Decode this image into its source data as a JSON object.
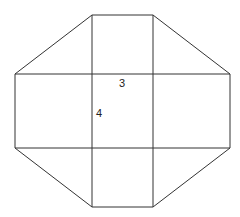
{
  "diagram": {
    "labels": {
      "top_side": "3",
      "left_side": "4"
    },
    "colors": {
      "stroke": "#333333",
      "background": "#ffffff"
    }
  }
}
